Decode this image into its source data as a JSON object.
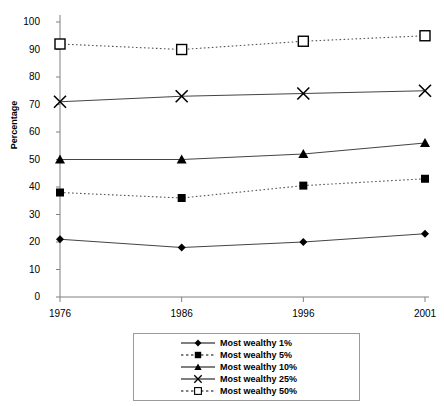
{
  "chart_data": {
    "type": "line",
    "title": "",
    "xlabel": "",
    "ylabel": "Percentage",
    "categories": [
      "1976",
      "1986",
      "1996",
      "2001"
    ],
    "x": [
      1976,
      1986,
      1996,
      2001
    ],
    "ylim": [
      0,
      100
    ],
    "yticks": [
      0,
      10,
      20,
      30,
      40,
      50,
      60,
      70,
      80,
      90,
      100
    ],
    "grid": false,
    "legend_position": "bottom",
    "series": [
      {
        "name": "Most wealthy 1%",
        "values": [
          21,
          18,
          20,
          23
        ],
        "marker": "diamond",
        "marker_fill": "solid",
        "line_style": "solid",
        "color": "#000000"
      },
      {
        "name": "Most wealthy 5%",
        "values": [
          38,
          36,
          40.5,
          43
        ],
        "marker": "square",
        "marker_fill": "solid",
        "line_style": "dotted",
        "color": "#000000"
      },
      {
        "name": "Most wealthy 10%",
        "values": [
          50,
          50,
          52,
          56
        ],
        "marker": "triangle",
        "marker_fill": "solid",
        "line_style": "solid",
        "color": "#000000"
      },
      {
        "name": "Most wealthy 25%",
        "values": [
          71,
          73,
          74,
          75
        ],
        "marker": "cross",
        "marker_fill": "none",
        "line_style": "solid",
        "color": "#000000"
      },
      {
        "name": "Most wealthy 50%",
        "values": [
          92,
          90,
          93,
          95
        ],
        "marker": "square",
        "marker_fill": "open",
        "line_style": "dotted",
        "color": "#000000"
      }
    ]
  },
  "axis": {
    "y_title": "Percentage",
    "y_tick_labels": [
      "100",
      "90",
      "80",
      "70",
      "60",
      "50",
      "40",
      "30",
      "20",
      "10",
      "0"
    ],
    "x_tick_labels": [
      "1976",
      "1986",
      "1996",
      "2001"
    ]
  },
  "legend": {
    "entries": [
      {
        "label": "Most wealthy 1%"
      },
      {
        "label": "Most wealthy 5%"
      },
      {
        "label": "Most wealthy 10%"
      },
      {
        "label": "Most wealthy 25%"
      },
      {
        "label": "Most wealthy 50%"
      }
    ]
  },
  "colors": {
    "ink": "#000000",
    "axis": "#808080",
    "legend_border": "#9a9a9a",
    "background": "#ffffff"
  }
}
